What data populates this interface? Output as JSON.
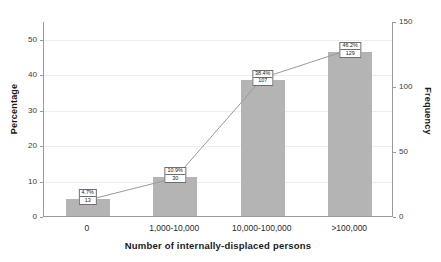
{
  "chart_data": {
    "type": "bar",
    "title": "",
    "subtitle": "",
    "xlabel": "Number of internally-displaced persons",
    "ylabel": "Percentage",
    "y2label": "Frequency",
    "categories": [
      "0",
      "1,000-10,000",
      "10,000-100,000",
      ">100,000"
    ],
    "values": [
      4.7,
      10.9,
      38.4,
      46.2
    ],
    "ylim": [
      0,
      55
    ],
    "y2lim": [
      0,
      150
    ],
    "yticks": [
      0,
      10,
      20,
      30,
      40,
      50
    ],
    "y2ticks": [
      0,
      50,
      100,
      150
    ],
    "grid": true,
    "legend": false,
    "bar_color": "#b4b4b4",
    "line_color": "#9a9a9a",
    "series": [
      {
        "name": "Percentage",
        "values": [
          4.7,
          10.9,
          38.4,
          46.2
        ],
        "axis": "left",
        "render": "bar"
      },
      {
        "name": "Frequency",
        "values": [
          13,
          30,
          107,
          129
        ],
        "axis": "right",
        "render": "line"
      }
    ],
    "annotations": [
      {
        "percent": "4.7%",
        "frequency": "13"
      },
      {
        "percent": "10.9%",
        "frequency": "30"
      },
      {
        "percent": "38.4%",
        "frequency": "107"
      },
      {
        "percent": "46.2%",
        "frequency": "129"
      }
    ]
  },
  "axes": {
    "left_ticks": [
      "50",
      "40",
      "30",
      "20",
      "10",
      "0"
    ],
    "right_ticks": [
      "150",
      "100",
      "50",
      "0"
    ]
  }
}
